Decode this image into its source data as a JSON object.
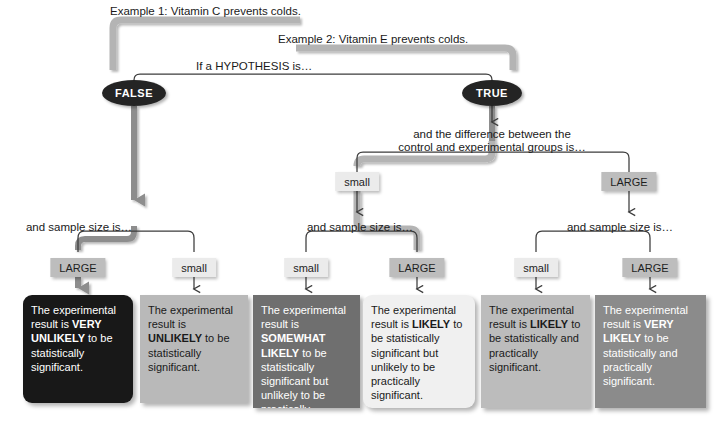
{
  "diagram": {
    "title_examples": [
      {
        "id": "example-1",
        "text": "Example 1: Vitamin C prevents colds.",
        "x": 110,
        "y": 5
      },
      {
        "id": "example-2",
        "text": "Example 2: Vitamin E prevents colds.",
        "x": 278,
        "y": 33
      }
    ],
    "root_question": {
      "text": "If a HYPOTHESIS is…",
      "x": 196,
      "y": 60
    },
    "decisions": [
      {
        "id": "false-node",
        "label": "FALSE",
        "cx": 134,
        "cy": 93,
        "rx": 32,
        "ry": 13
      },
      {
        "id": "true-node",
        "label": "TRUE",
        "cx": 492,
        "cy": 93,
        "rx": 30,
        "ry": 13
      }
    ],
    "difference_question": {
      "line1": "and the difference between the",
      "line2": "control and experimental groups is…",
      "cx": 492,
      "y": 128
    },
    "difference_tags": [
      {
        "id": "diff-small",
        "label": "small",
        "kind": "small",
        "cx": 357,
        "y": 172
      },
      {
        "id": "diff-large",
        "label": "LARGE",
        "kind": "large",
        "cx": 629,
        "y": 172
      }
    ],
    "sample_size_questions": [
      {
        "id": "sample-size-false",
        "text": "and sample size is…",
        "cx": 79,
        "y": 221
      },
      {
        "id": "sample-size-true-small",
        "text": "and sample size is…",
        "cx": 360,
        "y": 221
      },
      {
        "id": "sample-size-true-large",
        "text": "and sample size is…",
        "cx": 620,
        "y": 221
      }
    ],
    "sample_tags": [
      {
        "id": "tag-1",
        "label": "LARGE",
        "kind": "large",
        "cx": 78,
        "y": 258
      },
      {
        "id": "tag-2",
        "label": "small",
        "kind": "small",
        "cx": 194,
        "y": 258
      },
      {
        "id": "tag-3",
        "label": "small",
        "kind": "small",
        "cx": 306,
        "y": 258
      },
      {
        "id": "tag-4",
        "label": "LARGE",
        "kind": "large",
        "cx": 417,
        "y": 258
      },
      {
        "id": "tag-5",
        "label": "small",
        "kind": "small",
        "cx": 536,
        "y": 258
      },
      {
        "id": "tag-6",
        "label": "LARGE",
        "kind": "large",
        "cx": 650,
        "y": 258
      }
    ],
    "outcomes": [
      {
        "id": "outcome-very-unlikely",
        "html": "The experimental result is <b>VERY UNLIKELY</b> to be statistically significant.",
        "bg": "#181818",
        "fg": "#ffffff",
        "x": 23,
        "y": 295,
        "w": 110,
        "h": 108
      },
      {
        "id": "outcome-unlikely",
        "html": "The experimental result is <b>UNLIKELY</b> to be statistically significant.",
        "bg": "#b9b9b9",
        "fg": "#1a1a1a",
        "x": 140,
        "y": 295,
        "w": 108,
        "h": 108
      },
      {
        "id": "outcome-somewhat-likely",
        "html": "The experimental result is <b>SOMEWHAT LIKELY</b> to be statistically significant but unlikely to be practically significant.",
        "bg": "#6f6f6f",
        "fg": "#ffffff",
        "x": 253,
        "y": 295,
        "w": 107,
        "h": 113
      },
      {
        "id": "outcome-likely-not-practical",
        "html": "The experimental result is <b>LIKELY</b> to be statistically significant but unlikely to be practically significant.",
        "bg": "#f0f0f0",
        "fg": "#1a1a1a",
        "x": 363,
        "y": 295,
        "w": 112,
        "h": 113
      },
      {
        "id": "outcome-likely-both",
        "html": "The experimental result is <b>LIKELY</b> to be statistically and practically significant.",
        "bg": "#bcbcbc",
        "fg": "#1a1a1a",
        "x": 481,
        "y": 295,
        "w": 109,
        "h": 113
      },
      {
        "id": "outcome-very-likely-both",
        "html": "The experimental result is <b>VERY LIKELY</b> to be statistically and practically significant.",
        "bg": "#8b8b8b",
        "fg": "#ffffff",
        "x": 595,
        "y": 295,
        "w": 111,
        "h": 113
      }
    ],
    "colors": {
      "highlight_path": "#b4b4b4",
      "thin_connector": "#3c3c3c",
      "node_fill": "#242424",
      "tag_large": "#bdbdbd",
      "tag_small": "#ebebeb"
    }
  }
}
